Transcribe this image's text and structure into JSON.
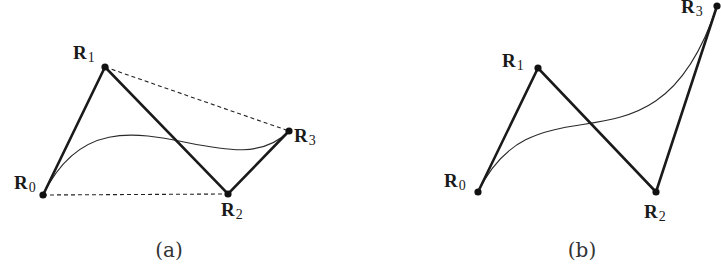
{
  "figure": {
    "colors": {
      "line": "#1a1a1a",
      "background": "#ffffff"
    },
    "panels": [
      {
        "caption": "(a)",
        "points": {
          "R0": {
            "x": 43,
            "y": 195
          },
          "R1": {
            "x": 105,
            "y": 67
          },
          "R2": {
            "x": 228,
            "y": 194
          },
          "R3": {
            "x": 289,
            "y": 131
          }
        },
        "labels": [
          {
            "base": "R",
            "sub": "0"
          },
          {
            "base": "R",
            "sub": "1"
          },
          {
            "base": "R",
            "sub": "2"
          },
          {
            "base": "R",
            "sub": "3"
          }
        ],
        "dashed_segments": [
          "R1-R3",
          "R0-R2"
        ]
      },
      {
        "caption": "(b)",
        "points": {
          "R0": {
            "x": 478,
            "y": 192
          },
          "R1": {
            "x": 538,
            "y": 68
          },
          "R2": {
            "x": 656,
            "y": 192
          },
          "R3": {
            "x": 717,
            "y": 6
          }
        },
        "labels": [
          {
            "base": "R",
            "sub": "0"
          },
          {
            "base": "R",
            "sub": "1"
          },
          {
            "base": "R",
            "sub": "2"
          },
          {
            "base": "R",
            "sub": "3"
          }
        ],
        "dashed_segments": []
      }
    ]
  }
}
